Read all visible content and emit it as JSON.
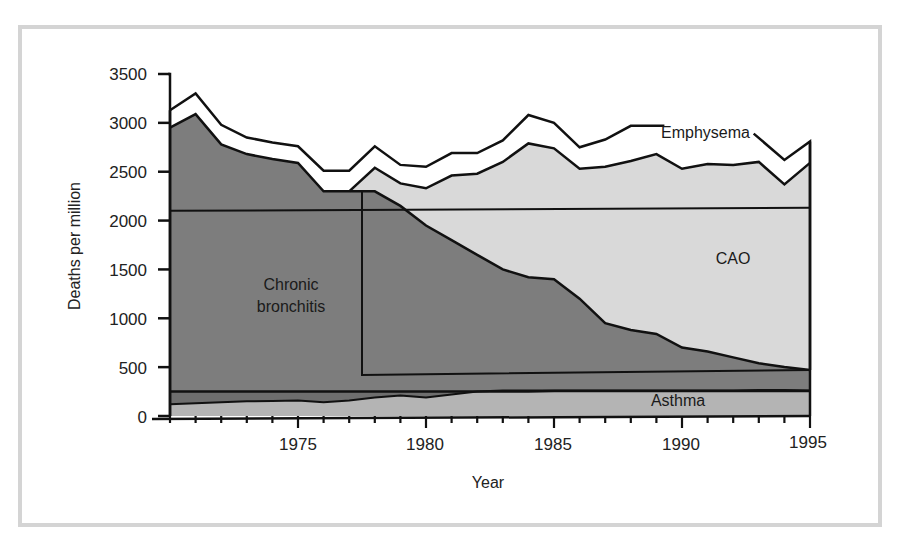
{
  "chart_data": {
    "type": "area",
    "title": "",
    "xlabel": "Year",
    "ylabel": "Deaths per million",
    "xlim": [
      1970,
      1995
    ],
    "ylim": [
      0,
      3500
    ],
    "x_ticks": [
      1975,
      1980,
      1985,
      1990,
      1995
    ],
    "y_ticks": [
      0,
      500,
      1000,
      1500,
      2000,
      2500,
      3000,
      3500
    ],
    "grid": false,
    "legend": "inline labels",
    "x": [
      1970,
      1971,
      1972,
      1973,
      1974,
      1975,
      1976,
      1977,
      1978,
      1979,
      1980,
      1981,
      1982,
      1983,
      1984,
      1985,
      1986,
      1987,
      1988,
      1989,
      1990,
      1991,
      1992,
      1993,
      1994,
      1995
    ],
    "series": [
      {
        "name": "Asthma",
        "stack": "bottom band (cumulative top)",
        "values": [
          120,
          130,
          140,
          150,
          155,
          160,
          140,
          160,
          190,
          210,
          190,
          220,
          250,
          260,
          260,
          260,
          260,
          260,
          260,
          260,
          260,
          260,
          260,
          265,
          265,
          260
        ]
      },
      {
        "name": "Asthma band top line",
        "values": [
          250,
          250,
          250,
          250,
          250,
          250,
          250,
          250,
          250,
          250,
          250,
          250,
          250,
          250,
          250,
          255,
          255,
          255,
          255,
          255,
          255,
          255,
          255,
          255,
          255,
          255
        ]
      },
      {
        "name": "Chronic bronchitis",
        "stack": "cumulative top",
        "values": [
          2950,
          3090,
          2780,
          2680,
          2630,
          2590,
          2300,
          2300,
          2300,
          2150,
          1950,
          1800,
          1650,
          1500,
          1420,
          1400,
          1200,
          950,
          880,
          840,
          700,
          660,
          600,
          540,
          500,
          470
        ]
      },
      {
        "name": "CAO",
        "stack": "cumulative top (from 1977)",
        "values": [
          null,
          null,
          null,
          null,
          null,
          null,
          null,
          2300,
          2540,
          2380,
          2330,
          2460,
          2480,
          2600,
          2790,
          2740,
          2530,
          2550,
          2610,
          2680,
          2530,
          2580,
          2570,
          2600,
          2370,
          2590
        ]
      },
      {
        "name": "Emphysema",
        "stack": "cumulative top",
        "values": [
          3130,
          3300,
          2980,
          2850,
          2800,
          2760,
          2510,
          2510,
          2760,
          2570,
          2550,
          2690,
          2690,
          2820,
          3080,
          3000,
          2750,
          2830,
          2970,
          2970,
          2790,
          2800,
          2780,
          2800,
          2620,
          2810
        ]
      }
    ],
    "annotations": [
      {
        "text": "Emphysema",
        "x": 1991.2,
        "y": 2930
      },
      {
        "text": "CAO",
        "x": 1991.5,
        "y": 1630
      },
      {
        "text": "Chronic bronchitis",
        "x": 1975.5,
        "y": 1420
      },
      {
        "text": "Asthma",
        "x": 1990,
        "y": 160
      },
      {
        "text": "Inset rectangle 1",
        "from": [
          1970,
          2100
        ],
        "to": [
          1995,
          2130
        ]
      },
      {
        "text": "Inset rectangle 2",
        "from": [
          1977.5,
          420
        ],
        "to": [
          1995,
          470
        ]
      }
    ],
    "colors": {
      "emphysema_band": "#ffffff",
      "cao": "#d9d9d9",
      "chronic_bronchitis": "#7d7d7d",
      "asthma_dark": "#6e6e6e",
      "asthma_light": "#b4b4b4",
      "outline": "#111111",
      "frame": "#d4d4d4"
    }
  },
  "labels": {
    "y_axis_title": "Deaths per million",
    "x_axis_title": "Year",
    "emphysema": "Emphysema",
    "cao": "CAO",
    "chronic_line1": "Chronic",
    "chronic_line2": "bronchitis",
    "asthma": "Asthma",
    "y_ticks": [
      "3500",
      "3000",
      "2500",
      "2000",
      "1500",
      "1000",
      "500",
      "0"
    ],
    "x_ticks": [
      "1975",
      "1980",
      "1985",
      "1990",
      "1995"
    ]
  }
}
